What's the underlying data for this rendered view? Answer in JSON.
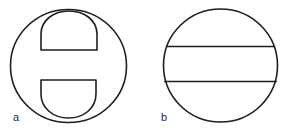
{
  "figure": {
    "panels": [
      {
        "id": "a",
        "label": "a",
        "description": "Circle containing two D-shaped (half-disc) regions: one at top with flat edge facing down, one at bottom with flat edge facing up, separated by a horizontal gap",
        "outer_shape": "ellipse",
        "inner_shapes": [
          "upper-half-disc",
          "lower-half-disc"
        ]
      },
      {
        "id": "b",
        "label": "b",
        "description": "Circle divided by two parallel horizontal chords into three bands",
        "outer_shape": "circle",
        "chords": 2
      }
    ],
    "colors": {
      "stroke": "#1e1e1e",
      "background": "#ffffff",
      "label": "#2a2a2a"
    }
  }
}
